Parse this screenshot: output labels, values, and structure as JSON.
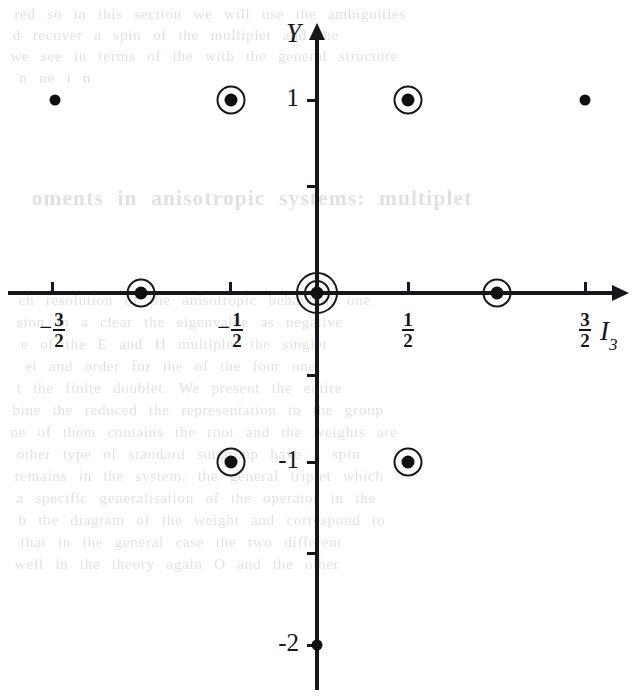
{
  "figure": {
    "kind": "weight-diagram",
    "background_color": "#ffffff",
    "ink_color": "#18161a"
  },
  "axes": {
    "x": {
      "name": "I3",
      "label_main": "I",
      "label_sub": "3",
      "label_x": 600,
      "label_y": 316,
      "line_y": 293,
      "line_x_start": 8,
      "line_x_end": 612,
      "arrow": "right",
      "origin_px": 317,
      "unit_px": 178,
      "ticks": [
        {
          "value": -1.5,
          "px": 52,
          "text": "-3/2",
          "sign": "−",
          "num": "3",
          "den": "2"
        },
        {
          "value": -0.5,
          "px": 230,
          "text": "-1/2",
          "sign": "−",
          "num": "1",
          "den": "2"
        },
        {
          "value": 0.5,
          "px": 408,
          "text": "1/2",
          "sign": "",
          "num": "1",
          "den": "2"
        },
        {
          "value": 1.5,
          "px": 585,
          "text": "3/2",
          "sign": "",
          "num": "3",
          "den": "2"
        }
      ]
    },
    "y": {
      "name": "Y",
      "label_main": "Y",
      "label_x": 286,
      "label_y": 18,
      "line_x": 317,
      "line_y_start": 40,
      "line_y_end": 690,
      "arrow": "up",
      "origin_px": 293,
      "unit_px": 96,
      "ticks": [
        {
          "value": 1,
          "px": 100,
          "text": "1",
          "labelled": true
        },
        {
          "value": 0.5,
          "px": 186,
          "text": "",
          "labelled": false
        },
        {
          "value": -0.5,
          "px": 375,
          "text": "",
          "labelled": false
        },
        {
          "value": -1,
          "px": 462,
          "text": "-1",
          "labelled": true
        },
        {
          "value": -1.5,
          "px": 553,
          "text": "",
          "labelled": false
        },
        {
          "value": -2,
          "px": 645,
          "text": "-2",
          "labelled": true
        }
      ]
    }
  },
  "chart_data": {
    "type": "scatter",
    "title": "",
    "xlabel": "I₃",
    "ylabel": "Y",
    "xlim": [
      -1.75,
      1.75
    ],
    "ylim": [
      -2.3,
      1.4
    ],
    "grid": false,
    "legend": null,
    "marker_styles": {
      "plain": "filled dot, no ring",
      "circled": "filled dot with one ring",
      "double-circled": "filled dot with two concentric rings"
    },
    "points": [
      {
        "x": -1.5,
        "y": 1,
        "style": "plain",
        "px": 55,
        "py": 100
      },
      {
        "x": -0.5,
        "y": 1,
        "style": "circled",
        "px": 231,
        "py": 100
      },
      {
        "x": 0.5,
        "y": 1,
        "style": "circled",
        "px": 408,
        "py": 100
      },
      {
        "x": 1.5,
        "y": 1,
        "style": "plain",
        "px": 585,
        "py": 100
      },
      {
        "x": -1,
        "y": 0,
        "style": "circled",
        "px": 141,
        "py": 293
      },
      {
        "x": 0,
        "y": 0,
        "style": "double-circled",
        "px": 317,
        "py": 293
      },
      {
        "x": 1,
        "y": 0,
        "style": "circled",
        "px": 497,
        "py": 293
      },
      {
        "x": -0.5,
        "y": -1,
        "style": "circled",
        "px": 231,
        "py": 462
      },
      {
        "x": 0.5,
        "y": -1,
        "style": "circled",
        "px": 408,
        "py": 462
      },
      {
        "x": 0,
        "y": -2,
        "style": "plain",
        "px": 317,
        "py": 645
      }
    ]
  },
  "bleed_through": {
    "note": "faint mirrored text from the reverse side of the scanned page",
    "heading": {
      "text": "oments in anisotropic systems: multiplet",
      "x": 36,
      "y": 186
    },
    "lines": [
      {
        "text": "red so in this section we will use the ambiguities",
        "x": 18,
        "y": 6
      },
      {
        "text": "d recover a spin of the    multiplet   and the",
        "x": 16,
        "y": 27
      },
      {
        "text": "we see in terms of the  with the  general structure",
        "x": 14,
        "y": 48
      },
      {
        "text": "n ne                                 i        n",
        "x": 20,
        "y": 70
      },
      {
        "text": "ch resolution  of the anisotropic behaviour one",
        "x": 22,
        "y": 292
      },
      {
        "text": "sion  in  a  clear  the  eigenvalue  as  negative",
        "x": 20,
        "y": 314
      },
      {
        "text": "e     of the  E   and  H   multiplet  the  singlet",
        "x": 24,
        "y": 336
      },
      {
        "text": "et    and  order  for   the   of   the   four   one",
        "x": 28,
        "y": 358
      },
      {
        "text": "t  the    finite   doublet.     We   present   the   entire",
        "x": 20,
        "y": 380
      },
      {
        "text": "bine  the  reduced  the  representation  to  the  group",
        "x": 16,
        "y": 402
      },
      {
        "text": "ne  of  them  contains  the  root  and  the  weights  are",
        "x": 14,
        "y": 424
      },
      {
        "text": "other  type  of  standard  subgroup  have  a  spin",
        "x": 20,
        "y": 446
      },
      {
        "text": "remains  in  the  system,  the  general  triplet  which",
        "x": 18,
        "y": 468
      },
      {
        "text": "a  specific  generalisation  of  the  operator   in  the",
        "x": 20,
        "y": 490
      },
      {
        "text": "b  the   diagram  of  the  weight  and  correspond  to",
        "x": 22,
        "y": 512
      },
      {
        "text": "that  in  the    general  case  the  two   different",
        "x": 24,
        "y": 534
      },
      {
        "text": "well  in  the   theory   again   O   and   the   other",
        "x": 18,
        "y": 556
      }
    ]
  }
}
